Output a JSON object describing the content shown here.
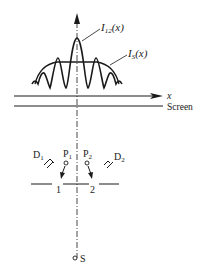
{
  "diagram": {
    "curve_labels": {
      "i12": {
        "base": "I",
        "sub": "12",
        "arg": "(x)"
      },
      "is": {
        "base": "I",
        "sub": "S",
        "arg": "(x)"
      }
    },
    "axis_label": "x",
    "screen_label": "Screen",
    "detectors": [
      {
        "base": "D",
        "sub": "1"
      },
      {
        "base": "D",
        "sub": "2"
      }
    ],
    "pins": [
      {
        "base": "P",
        "sub": "1"
      },
      {
        "base": "P",
        "sub": "2"
      }
    ],
    "slits": [
      "1",
      "2"
    ],
    "source_label": "S",
    "colors": {
      "ink": "#1a1a1a",
      "background": "#ffffff"
    }
  }
}
